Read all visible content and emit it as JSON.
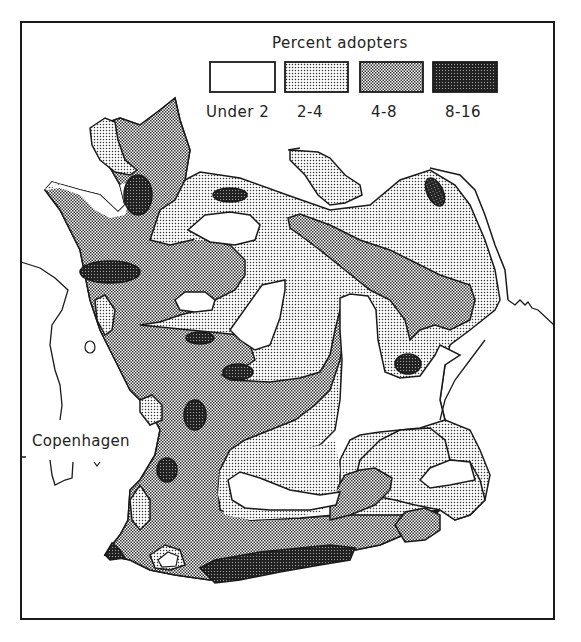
{
  "legend": {
    "title": "Percent adopters",
    "items": [
      {
        "label": "Under 2",
        "fill": "white",
        "color": "#ffffff"
      },
      {
        "label": "2-4",
        "fill": "light-dot-screen",
        "color": "#d9d9d9"
      },
      {
        "label": "4-8",
        "fill": "medium-dot-screen",
        "color": "#a6a6a6"
      },
      {
        "label": "8-16",
        "fill": "dark-dot-screen",
        "color": "#4d4d4d"
      }
    ]
  },
  "places": {
    "city": "Copenhagen"
  },
  "colors": {
    "outline": "#1a1a1a",
    "background": "#ffffff"
  }
}
